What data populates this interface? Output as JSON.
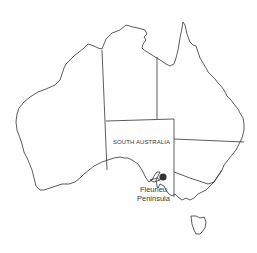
{
  "map": {
    "title": "Australia",
    "highlighted_state": "SOUTH AUSTRALIA",
    "marker": {
      "label_line1": "Fleurieu",
      "label_line2": "Peninsula",
      "color": "#333333"
    },
    "outline_color": "#333333",
    "background": "#ffffff"
  }
}
